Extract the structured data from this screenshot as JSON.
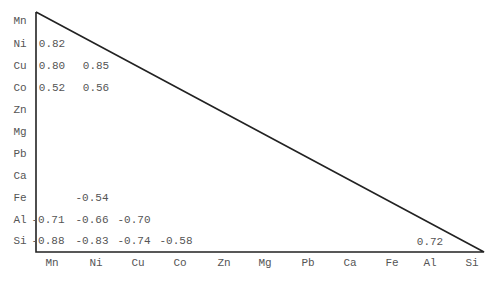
{
  "chart_data": {
    "type": "table",
    "title": "",
    "elements": [
      "Mn",
      "Ni",
      "Cu",
      "Co",
      "Zn",
      "Mg",
      "Pb",
      "Ca",
      "Fe",
      "Al",
      "Si"
    ],
    "row_labels": [
      "Mn",
      "Ni",
      "Cu",
      "Co",
      "Zn",
      "Mg",
      "Pb",
      "Ca",
      "Fe",
      "Al",
      "Si"
    ],
    "col_labels": [
      "Mn",
      "Ni",
      "Cu",
      "Co",
      "Zn",
      "Mg",
      "Pb",
      "Ca",
      "Fe",
      "Al",
      "Si"
    ],
    "cells": [
      {
        "row": "Ni",
        "col": "Mn",
        "value": "0.82"
      },
      {
        "row": "Cu",
        "col": "Mn",
        "value": "0.80"
      },
      {
        "row": "Cu",
        "col": "Ni",
        "value": "0.85"
      },
      {
        "row": "Co",
        "col": "Mn",
        "value": "0.52"
      },
      {
        "row": "Co",
        "col": "Ni",
        "value": "0.56"
      },
      {
        "row": "Fe",
        "col": "Ni",
        "value": "-0.54"
      },
      {
        "row": "Al",
        "col": "Mn",
        "value": "-0.71"
      },
      {
        "row": "Al",
        "col": "Ni",
        "value": "-0.66"
      },
      {
        "row": "Al",
        "col": "Cu",
        "value": "-0.70"
      },
      {
        "row": "Si",
        "col": "Mn",
        "value": "-0.88"
      },
      {
        "row": "Si",
        "col": "Ni",
        "value": "-0.83"
      },
      {
        "row": "Si",
        "col": "Cu",
        "value": "-0.74"
      },
      {
        "row": "Si",
        "col": "Co",
        "value": "-0.58"
      },
      {
        "row": "Si",
        "col": "Al",
        "value": "0.72"
      }
    ]
  }
}
